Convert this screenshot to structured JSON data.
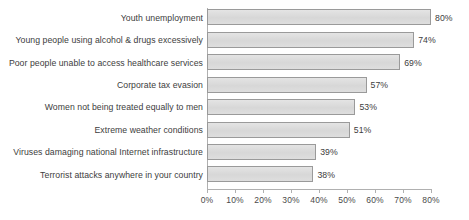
{
  "chart_data": {
    "type": "bar",
    "orientation": "horizontal",
    "title": "",
    "subtitle": "",
    "xlabel": "",
    "ylabel": "",
    "xlim": [
      0,
      80
    ],
    "xtick_step": 10,
    "xtick_labels": [
      "0%",
      "10%",
      "20%",
      "30%",
      "40%",
      "50%",
      "60%",
      "70%",
      "80%"
    ],
    "xtick_values": [
      0,
      10,
      20,
      30,
      40,
      50,
      60,
      70,
      80
    ],
    "grid": false,
    "legend": null,
    "value_suffix": "%",
    "categories": [
      "Youth unemployment",
      "Young people using alcohol & drugs excessively",
      "Poor people unable to access healthcare services",
      "Corporate tax evasion",
      "Women not being treated equally to men",
      "Extreme weather conditions",
      "Viruses damaging national Internet infrastructure",
      "Terrorist attacks anywhere in your country"
    ],
    "values": [
      80,
      74,
      69,
      57,
      53,
      51,
      39,
      38
    ],
    "data_labels": [
      "80%",
      "74%",
      "69%",
      "57%",
      "53%",
      "51%",
      "39%",
      "38%"
    ],
    "colors": {
      "bar_fill": "#dcdcdc",
      "bar_border": "#9a9a9a",
      "axis": "#b0b0b0",
      "text": "#3d3d3d",
      "background": "#ffffff"
    }
  }
}
